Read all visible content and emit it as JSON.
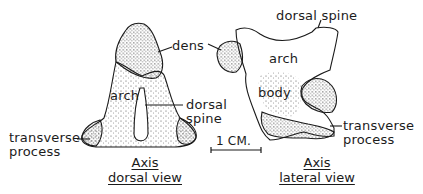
{
  "figure": {
    "dorsal_view": {
      "labels": {
        "dens": "dens",
        "arch": "arch",
        "dorsal_spine_line1": "dorsal",
        "dorsal_spine_line2": "spine",
        "transverse_line1": "transverse",
        "transverse_line2": "process"
      },
      "caption": {
        "line1": "Axis",
        "line2": "dorsal view"
      }
    },
    "lateral_view": {
      "labels": {
        "dorsal_spine": "dorsal spine",
        "arch": "arch",
        "body": "body",
        "transverse_line1": "transverse",
        "transverse_line2": "process"
      },
      "caption": {
        "line1": "Axis",
        "line2": "lateral view"
      }
    },
    "scale_bar": {
      "label": "1 CM."
    },
    "colors": {
      "ink": "#1a1a1a",
      "background": "#ffffff"
    }
  }
}
